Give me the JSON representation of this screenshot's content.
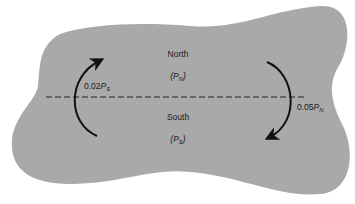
{
  "diagram": {
    "regions": [
      {
        "name": "North",
        "population_symbol": "P",
        "population_subscript": "N"
      },
      {
        "name": "South",
        "population_symbol": "P",
        "population_subscript": "S"
      }
    ],
    "flows": [
      {
        "from": "South",
        "to": "North",
        "rate": "0.02",
        "symbol": "P",
        "subscript": "S",
        "side": "left"
      },
      {
        "from": "North",
        "to": "South",
        "rate": "0.05",
        "symbol": "P",
        "subscript": "N",
        "side": "right"
      }
    ],
    "divider": "dashed boundary between North and South",
    "colors": {
      "region_fill": "#a9a9a9",
      "background": "#ffffff",
      "ink": "#111111"
    }
  }
}
